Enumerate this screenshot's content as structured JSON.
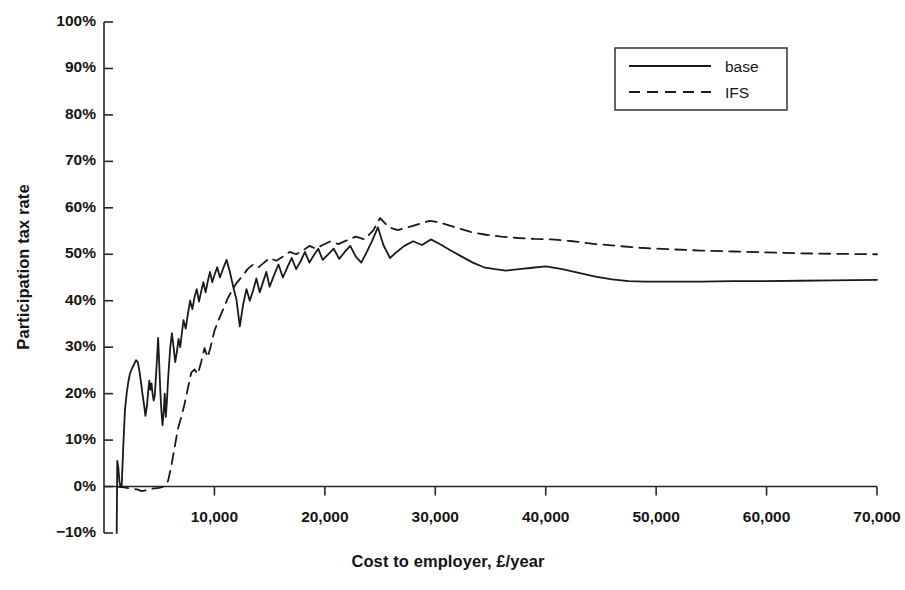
{
  "chart_data": {
    "type": "line",
    "title": "",
    "xlabel": "Cost to employer, £/year",
    "ylabel": "Participation tax rate",
    "xlim": [
      0,
      70000
    ],
    "ylim": [
      -0.1,
      1.0
    ],
    "grid": false,
    "legend_position": "top-right",
    "x_ticks": [
      {
        "value": 10000,
        "label": "10,000"
      },
      {
        "value": 20000,
        "label": "20,000"
      },
      {
        "value": 30000,
        "label": "30,000"
      },
      {
        "value": 40000,
        "label": "40,000"
      },
      {
        "value": 50000,
        "label": "50,000"
      },
      {
        "value": 60000,
        "label": "60,000"
      },
      {
        "value": 70000,
        "label": "70,000"
      }
    ],
    "y_ticks": [
      {
        "value": 1.0,
        "label": "100%"
      },
      {
        "value": 0.9,
        "label": "90%"
      },
      {
        "value": 0.8,
        "label": "80%"
      },
      {
        "value": 0.7,
        "label": "70%"
      },
      {
        "value": 0.6,
        "label": "60%"
      },
      {
        "value": 0.5,
        "label": "50%"
      },
      {
        "value": 0.4,
        "label": "40%"
      },
      {
        "value": 0.3,
        "label": "30%"
      },
      {
        "value": 0.2,
        "label": "20%"
      },
      {
        "value": 0.1,
        "label": "10%"
      },
      {
        "value": 0.0,
        "label": "0%"
      },
      {
        "value": -0.1,
        "label": "−10%"
      }
    ],
    "series": [
      {
        "name": "base",
        "style": "solid",
        "color": "#1a1a1a",
        "points": [
          [
            1150,
            -0.1
          ],
          [
            1200,
            0.055
          ],
          [
            1300,
            0.04
          ],
          [
            1400,
            0.01
          ],
          [
            1500,
            0.0
          ],
          [
            1600,
            0.0
          ],
          [
            1750,
            0.09
          ],
          [
            1900,
            0.165
          ],
          [
            2050,
            0.2
          ],
          [
            2200,
            0.225
          ],
          [
            2350,
            0.243
          ],
          [
            2500,
            0.252
          ],
          [
            2700,
            0.262
          ],
          [
            2900,
            0.272
          ],
          [
            3050,
            0.268
          ],
          [
            3200,
            0.25
          ],
          [
            3350,
            0.225
          ],
          [
            3500,
            0.196
          ],
          [
            3650,
            0.172
          ],
          [
            3750,
            0.152
          ],
          [
            3900,
            0.175
          ],
          [
            4000,
            0.205
          ],
          [
            4100,
            0.228
          ],
          [
            4200,
            0.208
          ],
          [
            4300,
            0.222
          ],
          [
            4400,
            0.2
          ],
          [
            4500,
            0.185
          ],
          [
            4600,
            0.196
          ],
          [
            4700,
            0.235
          ],
          [
            4800,
            0.275
          ],
          [
            4900,
            0.32
          ],
          [
            5000,
            0.265
          ],
          [
            5100,
            0.205
          ],
          [
            5200,
            0.162
          ],
          [
            5300,
            0.132
          ],
          [
            5400,
            0.16
          ],
          [
            5500,
            0.2
          ],
          [
            5600,
            0.15
          ],
          [
            5700,
            0.185
          ],
          [
            5800,
            0.23
          ],
          [
            5900,
            0.265
          ],
          [
            6000,
            0.3
          ],
          [
            6150,
            0.33
          ],
          [
            6300,
            0.3
          ],
          [
            6450,
            0.268
          ],
          [
            6600,
            0.29
          ],
          [
            6750,
            0.318
          ],
          [
            6900,
            0.3
          ],
          [
            7050,
            0.33
          ],
          [
            7200,
            0.358
          ],
          [
            7400,
            0.34
          ],
          [
            7600,
            0.372
          ],
          [
            7800,
            0.4
          ],
          [
            8000,
            0.382
          ],
          [
            8200,
            0.408
          ],
          [
            8400,
            0.425
          ],
          [
            8600,
            0.398
          ],
          [
            8800,
            0.42
          ],
          [
            9000,
            0.44
          ],
          [
            9200,
            0.418
          ],
          [
            9400,
            0.442
          ],
          [
            9600,
            0.462
          ],
          [
            9800,
            0.44
          ],
          [
            10000,
            0.455
          ],
          [
            10250,
            0.472
          ],
          [
            10500,
            0.45
          ],
          [
            10800,
            0.47
          ],
          [
            11100,
            0.488
          ],
          [
            11400,
            0.462
          ],
          [
            11700,
            0.43
          ],
          [
            12000,
            0.402
          ],
          [
            12300,
            0.345
          ],
          [
            12600,
            0.392
          ],
          [
            12900,
            0.425
          ],
          [
            13200,
            0.4
          ],
          [
            13500,
            0.422
          ],
          [
            13800,
            0.448
          ],
          [
            14100,
            0.418
          ],
          [
            14400,
            0.44
          ],
          [
            14700,
            0.462
          ],
          [
            15000,
            0.43
          ],
          [
            15400,
            0.455
          ],
          [
            15800,
            0.478
          ],
          [
            16200,
            0.45
          ],
          [
            16600,
            0.472
          ],
          [
            17000,
            0.492
          ],
          [
            17400,
            0.468
          ],
          [
            17800,
            0.485
          ],
          [
            18200,
            0.505
          ],
          [
            18600,
            0.482
          ],
          [
            19000,
            0.498
          ],
          [
            19400,
            0.512
          ],
          [
            19800,
            0.488
          ],
          [
            20300,
            0.5
          ],
          [
            20800,
            0.512
          ],
          [
            21300,
            0.49
          ],
          [
            21800,
            0.505
          ],
          [
            22300,
            0.518
          ],
          [
            22800,
            0.495
          ],
          [
            23300,
            0.482
          ],
          [
            23800,
            0.505
          ],
          [
            24300,
            0.53
          ],
          [
            24800,
            0.558
          ],
          [
            25300,
            0.52
          ],
          [
            25900,
            0.492
          ],
          [
            26500,
            0.505
          ],
          [
            27200,
            0.518
          ],
          [
            28000,
            0.528
          ],
          [
            28800,
            0.52
          ],
          [
            29600,
            0.532
          ],
          [
            30400,
            0.522
          ],
          [
            31400,
            0.508
          ],
          [
            32400,
            0.495
          ],
          [
            33400,
            0.482
          ],
          [
            34400,
            0.472
          ],
          [
            35400,
            0.468
          ],
          [
            36400,
            0.465
          ],
          [
            37600,
            0.468
          ],
          [
            38800,
            0.471
          ],
          [
            40000,
            0.474
          ],
          [
            41500,
            0.468
          ],
          [
            43000,
            0.46
          ],
          [
            44500,
            0.452
          ],
          [
            46000,
            0.446
          ],
          [
            47500,
            0.442
          ],
          [
            49000,
            0.441
          ],
          [
            51000,
            0.441
          ],
          [
            54000,
            0.441
          ],
          [
            57000,
            0.442
          ],
          [
            60000,
            0.442
          ],
          [
            63000,
            0.443
          ],
          [
            66000,
            0.444
          ],
          [
            70000,
            0.445
          ]
        ]
      },
      {
        "name": "IFS",
        "style": "dashed",
        "color": "#1a1a1a",
        "points": [
          [
            1200,
            0.0
          ],
          [
            1800,
            -0.002
          ],
          [
            2400,
            -0.004
          ],
          [
            3000,
            -0.006
          ],
          [
            3400,
            -0.01
          ],
          [
            3800,
            -0.008
          ],
          [
            4200,
            -0.005
          ],
          [
            4600,
            -0.004
          ],
          [
            5000,
            -0.003
          ],
          [
            5400,
            0.0
          ],
          [
            5800,
            0.012
          ],
          [
            6100,
            0.045
          ],
          [
            6400,
            0.085
          ],
          [
            6700,
            0.125
          ],
          [
            7000,
            0.15
          ],
          [
            7300,
            0.178
          ],
          [
            7600,
            0.212
          ],
          [
            7900,
            0.245
          ],
          [
            8200,
            0.252
          ],
          [
            8500,
            0.242
          ],
          [
            8800,
            0.268
          ],
          [
            9100,
            0.298
          ],
          [
            9400,
            0.278
          ],
          [
            9700,
            0.305
          ],
          [
            10000,
            0.335
          ],
          [
            10400,
            0.36
          ],
          [
            10800,
            0.382
          ],
          [
            11200,
            0.405
          ],
          [
            11600,
            0.422
          ],
          [
            12000,
            0.438
          ],
          [
            12500,
            0.452
          ],
          [
            13000,
            0.468
          ],
          [
            13500,
            0.478
          ],
          [
            14000,
            0.472
          ],
          [
            14500,
            0.482
          ],
          [
            15000,
            0.492
          ],
          [
            15600,
            0.486
          ],
          [
            16200,
            0.495
          ],
          [
            16800,
            0.505
          ],
          [
            17400,
            0.5
          ],
          [
            18000,
            0.508
          ],
          [
            18600,
            0.518
          ],
          [
            19200,
            0.512
          ],
          [
            19800,
            0.52
          ],
          [
            20500,
            0.528
          ],
          [
            21200,
            0.522
          ],
          [
            22000,
            0.53
          ],
          [
            22800,
            0.538
          ],
          [
            23600,
            0.532
          ],
          [
            24400,
            0.552
          ],
          [
            25000,
            0.578
          ],
          [
            25800,
            0.558
          ],
          [
            26600,
            0.552
          ],
          [
            27500,
            0.558
          ],
          [
            28500,
            0.565
          ],
          [
            29500,
            0.572
          ],
          [
            30500,
            0.568
          ],
          [
            31800,
            0.558
          ],
          [
            33200,
            0.548
          ],
          [
            34600,
            0.542
          ],
          [
            36000,
            0.538
          ],
          [
            37500,
            0.535
          ],
          [
            39000,
            0.533
          ],
          [
            40500,
            0.532
          ],
          [
            42500,
            0.528
          ],
          [
            44500,
            0.522
          ],
          [
            46500,
            0.518
          ],
          [
            48500,
            0.514
          ],
          [
            51000,
            0.511
          ],
          [
            54000,
            0.508
          ],
          [
            57000,
            0.506
          ],
          [
            60000,
            0.504
          ],
          [
            63000,
            0.502
          ],
          [
            66000,
            0.501
          ],
          [
            70000,
            0.5
          ]
        ]
      }
    ],
    "legend": [
      {
        "label": "base",
        "style": "solid"
      },
      {
        "label": "IFS",
        "style": "dashed"
      }
    ]
  }
}
